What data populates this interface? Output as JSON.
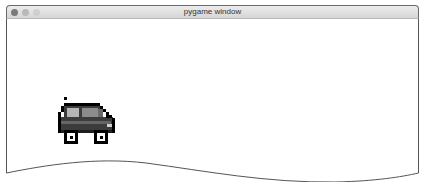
{
  "window": {
    "title": "pygame window",
    "traffic_lights": [
      "close",
      "minimize",
      "maximize"
    ]
  },
  "canvas": {
    "background": "#ffffff",
    "sprite": "car-sprite",
    "sprite_colors": {
      "body": "#3c3c3c",
      "window_glass": "#9a9a9a",
      "outline": "#000000",
      "wheel_hub": "#ffffff",
      "headlight": "#cfcfcf"
    }
  }
}
